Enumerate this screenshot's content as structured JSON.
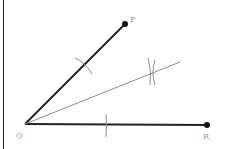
{
  "diagram": {
    "points": {
      "P": {
        "label": "P",
        "x": 125,
        "y": 24
      },
      "Q": {
        "label": "Q",
        "x": 25,
        "y": 124
      },
      "R": {
        "label": "R",
        "x": 207,
        "y": 125
      }
    },
    "bisector_end": {
      "x": 180,
      "y": 62
    },
    "colors": {
      "ray": "#222222",
      "bisector": "#8a8a8a",
      "arc": "#8a8a8a",
      "label": "#9a9a9a",
      "border": "#222222"
    }
  }
}
